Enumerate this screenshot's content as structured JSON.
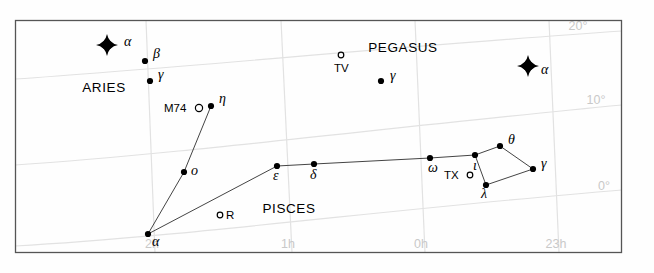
{
  "chart_data": {
    "type": "scatter",
    "xlabel": "Right Ascension",
    "ylabel": "Declination",
    "grid": true,
    "legend_position": "none",
    "axis": {
      "ra_ticks": [
        {
          "label": "2h",
          "x": 152,
          "y": 248
        },
        {
          "label": "1h",
          "x": 288,
          "y": 248
        },
        {
          "label": "0h",
          "x": 421,
          "y": 248
        },
        {
          "label": "23h",
          "x": 556,
          "y": 248
        }
      ],
      "dec_ticks": [
        {
          "label": "20°",
          "x": 578,
          "y": 30
        },
        {
          "label": "10°",
          "x": 596,
          "y": 104
        },
        {
          "label": "0°",
          "x": 604,
          "y": 190
        }
      ]
    },
    "constellations": [
      {
        "name": "ARIES",
        "x": 104,
        "y": 92
      },
      {
        "name": "PEGASUS",
        "x": 403,
        "y": 52
      },
      {
        "name": "PISCES",
        "x": 289,
        "y": 213
      }
    ],
    "stars": [
      {
        "id": "alp-ari",
        "label": "α",
        "kind": "bright",
        "x": 107,
        "y": 45,
        "lx": 124,
        "ly": 46
      },
      {
        "id": "bet-ari",
        "label": "β",
        "kind": "normal",
        "x": 145,
        "y": 61,
        "lx": 153,
        "ly": 58
      },
      {
        "id": "gam-ari",
        "label": "γ",
        "kind": "normal",
        "x": 150,
        "y": 81,
        "lx": 158,
        "ly": 79
      },
      {
        "id": "eta-psc",
        "label": "η",
        "kind": "normal",
        "x": 211,
        "y": 106,
        "lx": 219,
        "ly": 103
      },
      {
        "id": "omi-psc",
        "label": "o",
        "kind": "normal",
        "x": 184,
        "y": 172,
        "lx": 191,
        "ly": 175
      },
      {
        "id": "alp-psc",
        "label": "α",
        "kind": "normal",
        "x": 148,
        "y": 234,
        "lx": 152,
        "ly": 246
      },
      {
        "id": "eps-psc",
        "label": "ε",
        "kind": "normal",
        "x": 277,
        "y": 166,
        "lx": 273,
        "ly": 180
      },
      {
        "id": "del-psc",
        "label": "δ",
        "kind": "normal",
        "x": 314,
        "y": 164,
        "lx": 310,
        "ly": 179
      },
      {
        "id": "ome-psc",
        "label": "ω",
        "kind": "normal",
        "x": 430,
        "y": 158,
        "lx": 428,
        "ly": 172
      },
      {
        "id": "iot-psc",
        "label": "ι",
        "kind": "normal",
        "x": 475,
        "y": 155,
        "lx": 473,
        "ly": 170
      },
      {
        "id": "the-psc",
        "label": "θ",
        "kind": "normal",
        "x": 500,
        "y": 146,
        "lx": 508,
        "ly": 144
      },
      {
        "id": "gam-psc",
        "label": "γ",
        "kind": "normal",
        "x": 533,
        "y": 169,
        "lx": 541,
        "ly": 168
      },
      {
        "id": "lam-psc",
        "label": "λ",
        "kind": "normal",
        "x": 486,
        "y": 185,
        "lx": 481,
        "ly": 198
      },
      {
        "id": "gam-peg",
        "label": "γ",
        "kind": "normal",
        "x": 381,
        "y": 81,
        "lx": 390,
        "ly": 80
      },
      {
        "id": "alp-and",
        "label": "α",
        "kind": "bright",
        "x": 528,
        "y": 66,
        "lx": 541,
        "ly": 74
      }
    ],
    "objects": [
      {
        "id": "m74",
        "label": "M74",
        "type": "galaxy",
        "x": 199,
        "y": 108,
        "lx": 164,
        "ly": 112,
        "align": "left"
      },
      {
        "id": "r-psc",
        "label": "R",
        "type": "variable",
        "x": 220,
        "y": 215,
        "lx": 226,
        "ly": 219,
        "align": "left"
      },
      {
        "id": "tv-psc",
        "label": "TV",
        "type": "variable",
        "x": 341,
        "y": 55,
        "lx": 334,
        "ly": 72,
        "align": "left"
      },
      {
        "id": "tx-psc",
        "label": "TX",
        "type": "variable",
        "x": 470,
        "y": 175,
        "lx": 444,
        "ly": 179,
        "align": "left"
      }
    ],
    "constellation_lines": [
      {
        "from": "eta-psc",
        "to": "omi-psc"
      },
      {
        "from": "omi-psc",
        "to": "alp-psc"
      },
      {
        "from": "alp-psc",
        "to": "eps-psc"
      },
      {
        "from": "eps-psc",
        "to": "del-psc"
      },
      {
        "from": "del-psc",
        "to": "ome-psc"
      },
      {
        "from": "ome-psc",
        "to": "iot-psc"
      },
      {
        "from": "iot-psc",
        "to": "the-psc"
      },
      {
        "from": "the-psc",
        "to": "gam-psc"
      },
      {
        "from": "gam-psc",
        "to": "lam-psc"
      },
      {
        "from": "lam-psc",
        "to": "iot-psc"
      }
    ],
    "gridlines": {
      "ra": [
        {
          "label": "2h",
          "path": "M 146 20 L 155 253"
        },
        {
          "label": "1h",
          "path": "M 281 20 L 292 253"
        },
        {
          "label": "0h",
          "path": "M 415 20 L 425 253"
        },
        {
          "label": "23h",
          "path": "M 549 20 L 559 253"
        }
      ],
      "dec": [
        {
          "label": "20°",
          "path": "M 15 79 C 180 68, 400 46, 622 31"
        },
        {
          "label": "10°",
          "path": "M 15 165 C 180 154, 400 126, 622 105"
        },
        {
          "label": "0°",
          "path": "M 15 246 C 180 237, 400 208, 622 190"
        }
      ]
    },
    "colors": {
      "background": "#fefefe",
      "frame": "#555555",
      "grid": "#e2e2e2",
      "star": "#000000",
      "line": "#444444",
      "tick_label": "#c9c9c9"
    }
  }
}
